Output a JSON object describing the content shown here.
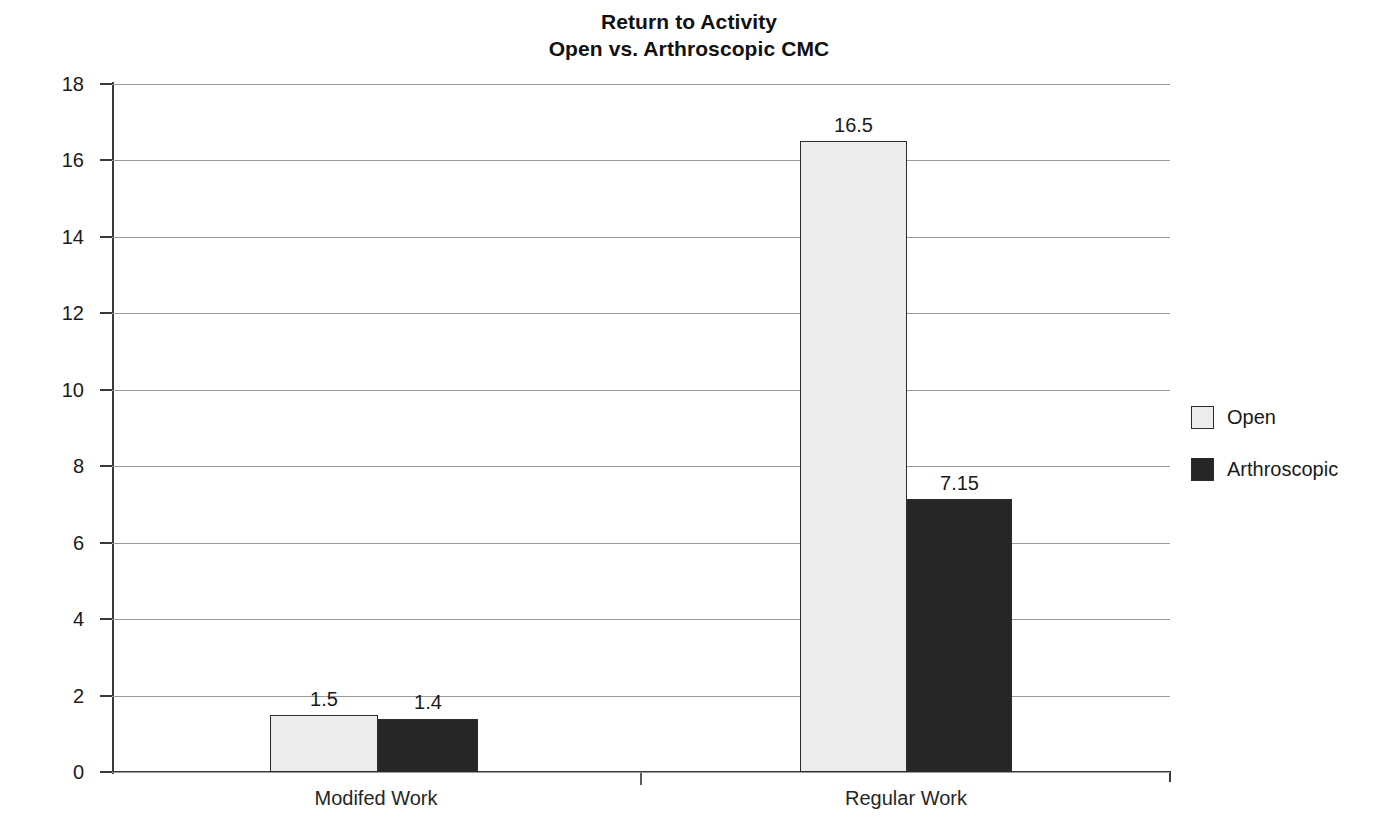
{
  "chart_data": {
    "type": "bar",
    "title": "Return to Activity",
    "subtitle": "Open vs. Arthroscopic CMC",
    "xlabel": "",
    "ylabel": "Number of Weeks",
    "ylim": [
      0,
      18
    ],
    "ytick_step": 2,
    "ytick_labels": [
      "18",
      "16",
      "14",
      "12",
      "10",
      "8",
      "6",
      "4",
      "2",
      "0"
    ],
    "ytick_values": [
      18,
      16,
      14,
      12,
      10,
      8,
      6,
      4,
      2,
      0
    ],
    "grid": true,
    "legend_position": "right",
    "categories": [
      "Modifed Work",
      "Regular Work"
    ],
    "series": [
      {
        "name": "Open",
        "color": "#ececec",
        "values": [
          1.5,
          16.5
        ],
        "labels": [
          "1.5",
          "16.5"
        ]
      },
      {
        "name": "Arthroscopic",
        "color": "#262626",
        "values": [
          1.4,
          7.15
        ],
        "labels": [
          "1.4",
          "7.15"
        ]
      }
    ]
  },
  "colors": {
    "background": "#ffffff",
    "axis": "#3a3a3a",
    "grid": "#9a9a9a",
    "text": "#1a1a1a",
    "open_fill": "#ececec",
    "arthroscopic_fill": "#262626",
    "bar_stroke": "#2b2b2b"
  }
}
